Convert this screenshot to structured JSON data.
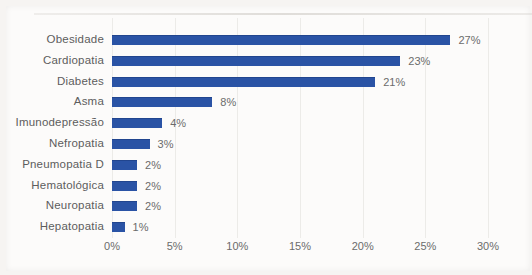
{
  "chart_data": {
    "type": "bar",
    "orientation": "horizontal",
    "title": "",
    "xlabel": "",
    "ylabel": "",
    "categories": [
      "Obesidade",
      "Cardiopatia",
      "Diabetes",
      "Asma",
      "Imunodepressão",
      "Nefropatia",
      "Pneumopatia D",
      "Hematológica",
      "Neuropatia",
      "Hepatopatia"
    ],
    "values": [
      27,
      23,
      21,
      8,
      4,
      3,
      2,
      2,
      2,
      1
    ],
    "value_labels": [
      "27%",
      "23%",
      "21%",
      "8%",
      "4%",
      "3%",
      "2%",
      "2%",
      "2%",
      "1%"
    ],
    "x_ticks": [
      "0%",
      "5%",
      "10%",
      "15%",
      "20%",
      "25%",
      "30%"
    ],
    "x_tick_values": [
      0,
      5,
      10,
      15,
      20,
      25,
      30
    ],
    "xlim": [
      0,
      30
    ],
    "grid": "vertical",
    "legend": "none",
    "bar_color": "#2a53a5",
    "label_color": "#5d5d5d",
    "tick_color": "#6b6b6b",
    "grid_color": "#ecebe8",
    "background_color": "#fcfbfa"
  }
}
